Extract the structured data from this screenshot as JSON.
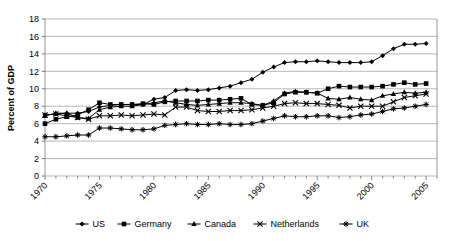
{
  "chart_data": {
    "type": "line",
    "title": "",
    "xlabel": "",
    "ylabel": "Percent of GDP",
    "ylim": [
      0,
      18
    ],
    "ytick_step": 2,
    "yticks": [
      "0",
      "2",
      "4",
      "6",
      "8",
      "10",
      "12",
      "14",
      "16",
      "18"
    ],
    "xlim": [
      1970,
      2006
    ],
    "xticks": [
      "1970",
      "1975",
      "1980",
      "1985",
      "1990",
      "1995",
      "2000",
      "2005"
    ],
    "xtick_values": [
      1970,
      1975,
      1980,
      1985,
      1990,
      1995,
      2000,
      2005
    ],
    "x": [
      1970,
      1971,
      1972,
      1973,
      1974,
      1975,
      1976,
      1977,
      1978,
      1979,
      1980,
      1981,
      1982,
      1983,
      1984,
      1985,
      1986,
      1987,
      1988,
      1989,
      1990,
      1991,
      1992,
      1993,
      1994,
      1995,
      1996,
      1997,
      1998,
      1999,
      2000,
      2001,
      2002,
      2003,
      2004,
      2005
    ],
    "grid": true,
    "legend_position": "bottom",
    "marker_shapes": {
      "US": "diamond",
      "Germany": "square",
      "Canada": "triangle",
      "Netherlands": "cross-x",
      "UK": "star"
    },
    "series": [
      {
        "name": "US",
        "marker": "diamond",
        "values": [
          7.0,
          7.1,
          7.2,
          7.2,
          7.4,
          7.9,
          8.1,
          8.2,
          8.2,
          8.2,
          8.8,
          9.0,
          9.8,
          9.9,
          9.8,
          9.9,
          10.1,
          10.3,
          10.7,
          11.1,
          11.9,
          12.5,
          13.0,
          13.1,
          13.1,
          13.2,
          13.1,
          13.0,
          13.0,
          13.0,
          13.1,
          13.8,
          14.6,
          15.1,
          15.1,
          15.2
        ]
      },
      {
        "name": "Germany",
        "marker": "square",
        "values": [
          6.0,
          6.5,
          6.8,
          7.0,
          7.6,
          8.4,
          8.2,
          8.2,
          8.2,
          8.3,
          8.2,
          8.5,
          8.6,
          8.6,
          8.6,
          8.7,
          8.7,
          8.8,
          8.9,
          8.2,
          8.1,
          8.4,
          9.4,
          9.6,
          9.6,
          9.5,
          10.0,
          10.3,
          10.2,
          10.2,
          10.2,
          10.3,
          10.5,
          10.7,
          10.5,
          10.6
        ]
      },
      {
        "name": "Canada",
        "marker": "triangle",
        "values": [
          6.9,
          7.2,
          7.2,
          6.7,
          6.6,
          7.6,
          7.9,
          8.0,
          8.0,
          8.2,
          8.4,
          8.6,
          8.4,
          8.2,
          8.1,
          8.2,
          8.3,
          8.4,
          8.4,
          8.3,
          8.1,
          8.6,
          9.5,
          9.7,
          9.6,
          9.5,
          8.9,
          8.8,
          9.0,
          8.8,
          8.7,
          9.2,
          9.4,
          9.6,
          9.5,
          9.6
        ]
      },
      {
        "name": "Netherlands",
        "marker": "cross-x",
        "values": [
          7.0,
          7.1,
          6.9,
          6.7,
          6.5,
          6.9,
          6.9,
          7.0,
          6.9,
          7.0,
          7.1,
          7.0,
          7.9,
          7.9,
          7.5,
          7.4,
          7.4,
          7.5,
          7.5,
          7.6,
          7.8,
          8.0,
          8.3,
          8.4,
          8.3,
          8.3,
          8.2,
          8.1,
          7.8,
          8.0,
          8.0,
          8.0,
          8.5,
          9.0,
          9.2,
          9.4
        ]
      },
      {
        "name": "UK",
        "marker": "star",
        "values": [
          4.5,
          4.5,
          4.6,
          4.7,
          4.7,
          5.5,
          5.5,
          5.4,
          5.3,
          5.3,
          5.4,
          5.8,
          5.9,
          6.0,
          5.9,
          5.9,
          6.0,
          5.9,
          5.9,
          6.0,
          6.3,
          6.6,
          6.9,
          6.8,
          6.8,
          6.9,
          6.9,
          6.7,
          6.8,
          7.0,
          7.1,
          7.4,
          7.7,
          7.8,
          8.0,
          8.2
        ]
      }
    ]
  },
  "legend": {
    "items": [
      {
        "label": "US"
      },
      {
        "label": "Germany"
      },
      {
        "label": "Canada"
      },
      {
        "label": "Netherlands"
      },
      {
        "label": "UK"
      }
    ]
  },
  "axis": {
    "y_title": "Percent of GDP"
  }
}
